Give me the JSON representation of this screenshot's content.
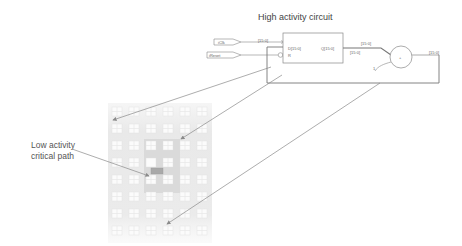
{
  "diagram": {
    "title": "High activity circuit",
    "annotation": {
      "line1": "Low activity",
      "line2": "critical path"
    },
    "circuit": {
      "inputs": [
        {
          "label": "iClk"
        },
        {
          "label": "iReset"
        }
      ],
      "register": {
        "input_pin": "D[15:0]",
        "reset_pin": "R",
        "output_pin": "Q[15:0]"
      },
      "bus_labels": {
        "clk_bus": "[15:0]",
        "q_bus_top": "[15:0]",
        "q_bus_bottom": "[15:0]",
        "adder_out": "[15:0]"
      },
      "adder": {
        "symbol": "+",
        "const_input": "1"
      }
    },
    "grid": {
      "columns": 6,
      "rows": 8,
      "highlight_region": {
        "col_start": 2,
        "col_end": 3,
        "row_start": 2,
        "row_end": 4
      }
    },
    "colors": {
      "line": "#7a7a7a",
      "arrow": "#888888",
      "grid_bg": "#ececec",
      "grid_cell": "#fafafa",
      "highlight_bg": "#d9d9d9",
      "critical_cell": "#a8a8a8"
    }
  }
}
